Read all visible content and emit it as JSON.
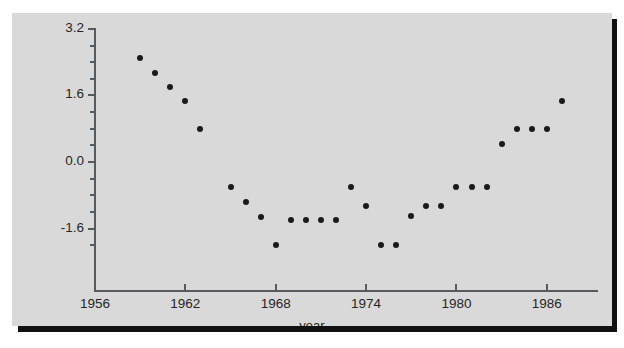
{
  "figure": {
    "background_color": "#ffffff",
    "panel_color": "#d9d9d9",
    "shadow_color": "#111111",
    "axis_color": "#555b5e",
    "marker_color": "#1a1a1a"
  },
  "chart_data": {
    "type": "scatter",
    "title": "",
    "xlabel": "year",
    "ylabel": "",
    "grid": false,
    "legend": null,
    "xlim": [
      1954.5,
      1988.5
    ],
    "ylim": [
      -2.4,
      3.5
    ],
    "xticks": [
      1956,
      1962,
      1968,
      1974,
      1980,
      1986
    ],
    "xtick_labels": [
      "1956",
      "1962",
      "1968",
      "1974",
      "1980",
      "1986"
    ],
    "yticks": [
      -1.6,
      0.0,
      1.6,
      3.2
    ],
    "ytick_labels": [
      "-1.6",
      "0.0",
      "1.6",
      "3.2"
    ],
    "y_minor_tick_step": 0.4,
    "x": [
      1959,
      1960,
      1961,
      1962,
      1963,
      1965,
      1966,
      1967,
      1968,
      1969,
      1970,
      1971,
      1972,
      1973,
      1974,
      1975,
      1976,
      1977,
      1978,
      1979,
      1980,
      1981,
      1982,
      1983,
      1984,
      1985,
      1986,
      1987
    ],
    "y": [
      2.51,
      2.14,
      1.8,
      1.47,
      0.79,
      -0.61,
      -0.96,
      -1.33,
      -1.99,
      -1.39,
      -1.39,
      -1.39,
      -1.39,
      -0.6,
      -1.06,
      -1.99,
      -1.99,
      -1.3,
      -1.06,
      -1.06,
      -0.6,
      -0.6,
      -0.6,
      0.44,
      0.79,
      0.79,
      0.79,
      1.47
    ],
    "marker": "filled-circle",
    "marker_size": 6,
    "n_points": 28
  },
  "axes": {
    "x_title": "year"
  }
}
